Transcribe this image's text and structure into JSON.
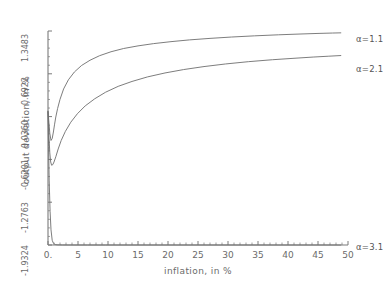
{
  "chart_data": {
    "type": "line",
    "title": "",
    "xlabel": "inflation, in %",
    "ylabel": "output deviation, in %",
    "xlim": [
      0,
      50
    ],
    "ylim": [
      -1.9324,
      1.3483
    ],
    "grid": false,
    "legend_position": "right-inline-annotations",
    "xticks": [
      0,
      5,
      10,
      15,
      20,
      25,
      30,
      35,
      40,
      45,
      50
    ],
    "xtick_labels": [
      "0.",
      "5",
      "10",
      "15",
      "20",
      "25",
      "30",
      "35",
      "40",
      "45",
      "50"
    ],
    "yticks": [
      -1.9324,
      -1.2763,
      -0.6201,
      0.036,
      0.6922,
      1.3483
    ],
    "ytick_labels": [
      "-1.9324",
      "-1.2763",
      "-0.6201",
      "0.0360",
      "0.6922",
      "1.3483"
    ],
    "series": [
      {
        "name": "a=1.1",
        "label": "α=1.1",
        "color": "#6e6e6e",
        "x": [
          0.0,
          0.15,
          0.3,
          0.5,
          0.7,
          0.9,
          1.1,
          1.3,
          1.6,
          2.0,
          2.6,
          3.4,
          4.4,
          5.6,
          7.0,
          8.6,
          10.5,
          12.6,
          15.0,
          17.6,
          20.5,
          23.6,
          27.0,
          30.6,
          34.4,
          38.4,
          42.0,
          45.0,
          47.4,
          48.8
        ],
        "y": [
          0.118,
          -0.05,
          -0.22,
          -0.33,
          -0.3,
          -0.2,
          -0.08,
          0.03,
          0.16,
          0.3,
          0.46,
          0.6,
          0.72,
          0.82,
          0.9,
          0.97,
          1.03,
          1.08,
          1.12,
          1.155,
          1.185,
          1.212,
          1.235,
          1.256,
          1.274,
          1.29,
          1.302,
          1.311,
          1.317,
          1.32
        ]
      },
      {
        "name": "a=2.1",
        "label": "α=2.1",
        "color": "#6e6e6e",
        "x": [
          0.0,
          0.15,
          0.3,
          0.45,
          0.6,
          0.8,
          1.0,
          1.3,
          1.7,
          2.2,
          2.9,
          3.8,
          4.9,
          6.2,
          7.8,
          9.6,
          11.7,
          14.0,
          16.6,
          19.5,
          22.6,
          26.0,
          29.6,
          33.4,
          37.4,
          41.0,
          44.2,
          46.8,
          48.8
        ],
        "y": [
          0.105,
          -0.25,
          -0.52,
          -0.66,
          -0.71,
          -0.7,
          -0.66,
          -0.58,
          -0.46,
          -0.33,
          -0.19,
          -0.05,
          0.08,
          0.2,
          0.31,
          0.41,
          0.5,
          0.575,
          0.645,
          0.705,
          0.757,
          0.803,
          0.843,
          0.878,
          0.908,
          0.93,
          0.949,
          0.962,
          0.972
        ]
      },
      {
        "name": "a=3.1",
        "label": "α=3.1",
        "color": "#6e6e6e",
        "x": [
          0.0,
          0.1,
          0.2,
          0.35,
          0.5,
          0.7,
          0.9,
          1.2,
          1.5,
          1.9,
          2.4,
          3.0,
          3.7,
          4.5,
          5.5,
          6.6,
          8.0,
          9.6,
          11.5,
          14.0,
          17.0,
          20.5,
          25.0,
          30.0,
          35.0,
          40.0,
          45.0,
          48.8
        ],
        "y": [
          0.118,
          -0.42,
          -0.95,
          -1.42,
          -1.7,
          -1.86,
          -1.905,
          -1.925,
          -1.93,
          -1.931,
          -1.932,
          -1.9322,
          -1.9323,
          -1.93235,
          -1.9324,
          -1.9324,
          -1.9324,
          -1.9324,
          -1.9324,
          -1.9324,
          -1.9324,
          -1.9324,
          -1.9324,
          -1.9324,
          -1.9324,
          -1.9324,
          -1.9324,
          -1.9324
        ]
      }
    ],
    "annotations": [
      {
        "text": "α=1.1",
        "x_px": 356,
        "y_px": 34
      },
      {
        "text": "α=2.1",
        "x_px": 356,
        "y_px": 64
      },
      {
        "text": "α=3.1",
        "x_px": 356,
        "y_px": 242
      }
    ],
    "axis_color": "#7a7a7a",
    "curve_color": "#6e6e6e",
    "background": "#ffffff"
  }
}
